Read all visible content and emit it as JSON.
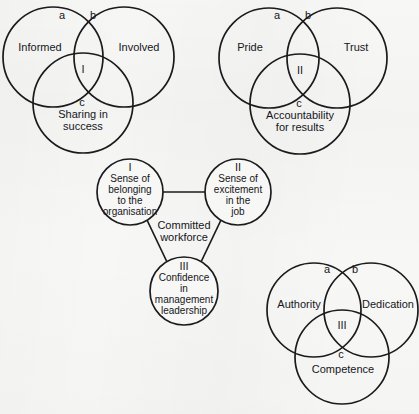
{
  "figure": {
    "line_color": "#1b1b1e",
    "text_color": "#15161a",
    "background_color": "#f7f7f6"
  },
  "groups": {
    "top_left": {
      "name": "informed-involved-sharing-venn",
      "roman": "I",
      "circles": [
        {
          "label": "Informed",
          "cx": 53,
          "cy": 57,
          "r": 50
        },
        {
          "label": "Involved",
          "cx": 124,
          "cy": 57,
          "r": 50
        },
        {
          "label": "Sharing in\nsuccess",
          "cx": 83,
          "cy": 103,
          "r": 50
        }
      ],
      "regions": [
        {
          "key": "a",
          "x": 62,
          "y": 16
        },
        {
          "key": "b",
          "x": 93,
          "y": 16
        },
        {
          "key": "c",
          "x": 82,
          "y": 103
        }
      ],
      "label_positions": {
        "left": {
          "x": 40,
          "y": 48
        },
        "right": {
          "x": 139,
          "y": 48
        },
        "bottom": {
          "x": 83,
          "y": 120
        },
        "roman": {
          "x": 83,
          "y": 70
        }
      }
    },
    "top_right": {
      "name": "pride-trust-accountability-venn",
      "roman": "II",
      "circles": [
        {
          "label": "Pride",
          "cx": 269,
          "cy": 58,
          "r": 50
        },
        {
          "label": "Trust",
          "cx": 337,
          "cy": 58,
          "r": 50
        },
        {
          "label": "Accountability\nfor results",
          "cx": 300,
          "cy": 104,
          "r": 50
        }
      ],
      "regions": [
        {
          "key": "a",
          "x": 277,
          "y": 16
        },
        {
          "key": "b",
          "x": 308,
          "y": 16
        },
        {
          "key": "c",
          "x": 299,
          "y": 104
        }
      ],
      "label_positions": {
        "left": {
          "x": 250,
          "y": 48
        },
        "right": {
          "x": 356,
          "y": 48
        },
        "bottom": {
          "x": 300,
          "y": 121
        },
        "roman": {
          "x": 300,
          "y": 71
        }
      }
    },
    "bottom_right": {
      "name": "authority-dedication-competence-venn",
      "roman": "III",
      "circles": [
        {
          "label": "Authority",
          "cx": 314,
          "cy": 310,
          "r": 47
        },
        {
          "label": "Dedication",
          "cx": 371,
          "cy": 310,
          "r": 47
        },
        {
          "label": "Competence",
          "cx": 342,
          "cy": 357,
          "r": 47
        }
      ],
      "regions": [
        {
          "key": "a",
          "x": 327,
          "y": 270
        },
        {
          "key": "b",
          "x": 355,
          "y": 270
        },
        {
          "key": "c",
          "x": 341,
          "y": 355
        }
      ],
      "label_positions": {
        "left": {
          "x": 299,
          "y": 305
        },
        "right": {
          "x": 388,
          "y": 305
        },
        "bottom": {
          "x": 343,
          "y": 370
        },
        "roman": {
          "x": 342,
          "y": 326
        }
      }
    },
    "center": {
      "name": "committed-workforce-cluster",
      "center_label": "Committed\nworkforce",
      "center_label_position": {
        "x": 184,
        "y": 231
      },
      "nodes": [
        {
          "roman": "I",
          "text": "Sense of\nbelonging\nto the\norganisation",
          "cx": 130,
          "cy": 192,
          "r": 33
        },
        {
          "roman": "II",
          "text": "Sense of\nexcitement\nin the\njob",
          "cx": 238,
          "cy": 192,
          "r": 33
        },
        {
          "roman": "III",
          "text": "Confidence\nin\nmanagement\nleadership",
          "cx": 184,
          "cy": 291,
          "r": 34
        }
      ],
      "connectors": [
        {
          "from": "I",
          "to": "II",
          "x1": 163,
          "y1": 192,
          "x2": 205,
          "y2": 192
        },
        {
          "from": "I",
          "to": "III",
          "x1": 147,
          "y1": 220,
          "x2": 167,
          "y2": 262
        },
        {
          "from": "II",
          "to": "III",
          "x1": 221,
          "y1": 220,
          "x2": 201,
          "y2": 262
        }
      ]
    }
  }
}
